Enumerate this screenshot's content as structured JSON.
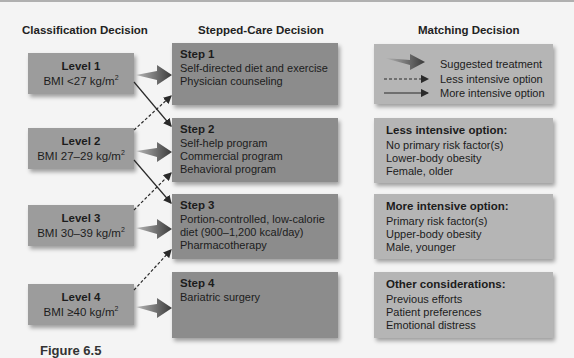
{
  "columns": {
    "classification": "Classification Decision",
    "stepped_care": "Stepped-Care Decision",
    "matching": "Matching Decision"
  },
  "levels": [
    {
      "title": "Level 1",
      "bmi_prefix": "BMI <27 kg/m",
      "sup": "2"
    },
    {
      "title": "Level 2",
      "bmi_prefix": "BMI 27–29 kg/m",
      "sup": "2"
    },
    {
      "title": "Level 3",
      "bmi_prefix": "BMI 30–39 kg/m",
      "sup": "2"
    },
    {
      "title": "Level 4",
      "bmi_prefix": "BMI ≥40 kg/m",
      "sup": "2"
    }
  ],
  "steps": [
    {
      "title": "Step 1",
      "lines": [
        "Self-directed diet and exercise",
        "Physician counseling"
      ]
    },
    {
      "title": "Step 2",
      "lines": [
        "Self-help program",
        "Commercial program",
        "Behavioral program"
      ]
    },
    {
      "title": "Step 3",
      "lines": [
        "Portion-controlled, low-calorie",
        "diet (900–1,200 kcal/day)",
        "Pharmacotherapy"
      ]
    },
    {
      "title": "Step 4",
      "lines": [
        "Bariatric surgery"
      ]
    }
  ],
  "legend": {
    "suggested": "Suggested treatment",
    "less": "Less intensive option",
    "more": "More intensive option"
  },
  "matching": [
    {
      "title": "Less intensive option:",
      "lines": [
        "No primary risk factor(s)",
        "Lower-body obesity",
        "Female, older"
      ]
    },
    {
      "title": "More intensive option:",
      "lines": [
        "Primary risk factor(s)",
        "Upper-body obesity",
        "Male, younger"
      ]
    },
    {
      "title": "Other considerations:",
      "lines": [
        "Previous efforts",
        "Patient preferences",
        "Emotional distress"
      ]
    }
  ],
  "caption": "Figure 6.5"
}
